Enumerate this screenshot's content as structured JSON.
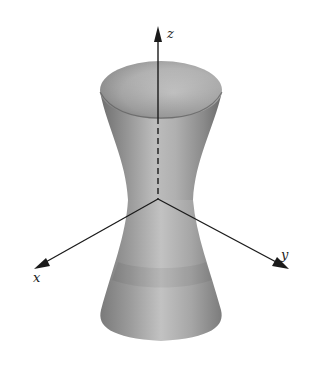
{
  "figure": {
    "background": "#ffffff",
    "surface_colors": {
      "light": "#d6d6d6",
      "mid": "#a8a8a8",
      "dark": "#6e6e6e",
      "rim_inner": "#c4c4c4"
    },
    "axis_color": "#1a1a1a"
  },
  "axes": {
    "x": {
      "label": "x"
    },
    "y": {
      "label": "y"
    },
    "z": {
      "label": "z"
    }
  }
}
